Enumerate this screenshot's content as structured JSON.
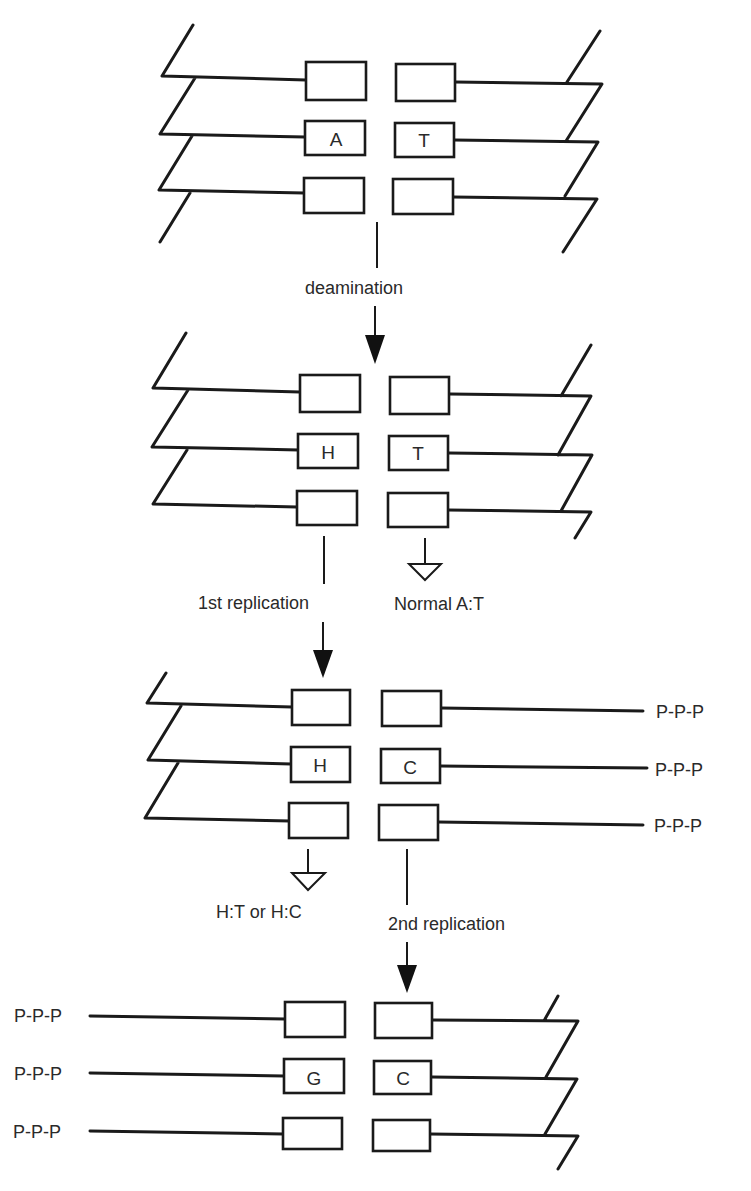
{
  "diagram": {
    "colors": {
      "ink": "#1a1a1a",
      "background": "#ffffff"
    },
    "stages": [
      {
        "id": "original",
        "left_bases": [
          "",
          "A",
          ""
        ],
        "right_bases": [
          "",
          "T",
          ""
        ]
      },
      {
        "id": "deaminated",
        "left_bases": [
          "",
          "H",
          ""
        ],
        "right_bases": [
          "",
          "T",
          ""
        ]
      },
      {
        "id": "first-replication-product",
        "left_bases": [
          "",
          "H",
          ""
        ],
        "right_bases": [
          "",
          "C",
          ""
        ],
        "right_ends": [
          "P-P-P",
          "P-P-P",
          "P-P-P"
        ]
      },
      {
        "id": "second-replication-product",
        "left_bases": [
          "",
          "G",
          ""
        ],
        "right_bases": [
          "",
          "C",
          ""
        ],
        "left_ends": [
          "P-P-P",
          "P-P-P",
          "P-P-P"
        ]
      }
    ],
    "steps": {
      "deamination": "deamination",
      "first_replication": "1st replication",
      "second_replication": "2nd replication"
    },
    "outcomes": {
      "normal": "Normal A:T",
      "h_pairs": "H:T or H:C"
    }
  }
}
